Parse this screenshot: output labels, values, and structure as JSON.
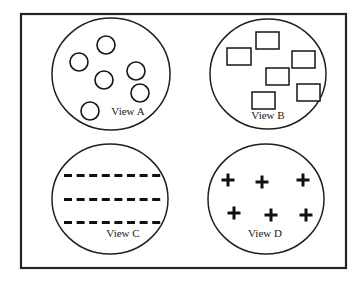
{
  "figure": {
    "background_color": "#ffffff",
    "frame": {
      "name": "outer-frame",
      "x": 21,
      "y": 14,
      "width": 325,
      "height": 254,
      "stroke_color": "#232323"
    },
    "views": [
      {
        "id": "view-a",
        "label": "View A",
        "label_x": 128,
        "label_y": 112,
        "ellipse": {
          "cx": 111,
          "cy": 74,
          "rx": 59,
          "ry": 56
        },
        "marker_type": "circle",
        "marker_count": 6,
        "markers": [
          {
            "cx": 106,
            "cy": 45,
            "r": 9
          },
          {
            "cx": 79,
            "cy": 62,
            "r": 9
          },
          {
            "cx": 136,
            "cy": 71,
            "r": 9
          },
          {
            "cx": 104,
            "cy": 80,
            "r": 9
          },
          {
            "cx": 140,
            "cy": 93,
            "r": 9
          },
          {
            "cx": 90,
            "cy": 111,
            "r": 9
          }
        ]
      },
      {
        "id": "view-b",
        "label": "View B",
        "label_x": 268,
        "label_y": 116,
        "ellipse": {
          "cx": 268,
          "cy": 74,
          "rx": 58,
          "ry": 55
        },
        "marker_type": "rectangle",
        "marker_count": 6,
        "markers": [
          {
            "x": 256,
            "y": 32,
            "w": 23,
            "h": 17
          },
          {
            "x": 227,
            "y": 48,
            "w": 24,
            "h": 17
          },
          {
            "x": 292,
            "y": 51,
            "w": 23,
            "h": 17
          },
          {
            "x": 266,
            "y": 68,
            "w": 23,
            "h": 17
          },
          {
            "x": 297,
            "y": 84,
            "w": 23,
            "h": 17
          },
          {
            "x": 252,
            "y": 92,
            "w": 23,
            "h": 17
          }
        ]
      },
      {
        "id": "view-c",
        "label": "View C",
        "label_x": 123,
        "label_y": 234,
        "ellipse": {
          "cx": 110,
          "cy": 199,
          "rx": 58,
          "ry": 55
        },
        "marker_type": "dash-row",
        "marker_count": 24,
        "rows": [
          {
            "y": 174,
            "count": 8,
            "x_start": 64,
            "x_step": 12.6,
            "dash_w": 8,
            "dash_h": 3
          },
          {
            "y": 198,
            "count": 8,
            "x_start": 64,
            "x_step": 12.6,
            "dash_w": 8,
            "dash_h": 3
          },
          {
            "y": 221,
            "count": 8,
            "x_start": 64,
            "x_step": 12.6,
            "dash_w": 8,
            "dash_h": 3
          }
        ]
      },
      {
        "id": "view-d",
        "label": "View D",
        "label_x": 265,
        "label_y": 234,
        "ellipse": {
          "cx": 266,
          "cy": 199,
          "rx": 58,
          "ry": 55
        },
        "marker_type": "plus",
        "marker_count": 6,
        "markers": [
          {
            "cx": 228,
            "cy": 180,
            "size": 13
          },
          {
            "cx": 262,
            "cy": 182,
            "size": 13
          },
          {
            "cx": 303,
            "cy": 180,
            "size": 13
          },
          {
            "cx": 234,
            "cy": 213,
            "size": 13
          },
          {
            "cx": 271,
            "cy": 215,
            "size": 13
          },
          {
            "cx": 306,
            "cy": 215,
            "size": 13
          }
        ]
      }
    ]
  }
}
